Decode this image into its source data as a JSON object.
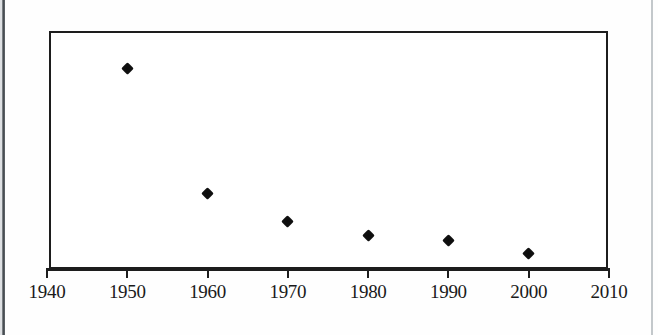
{
  "chart_data": {
    "type": "scatter",
    "title": "",
    "subtitle": "",
    "xlabel": "",
    "ylabel": "",
    "xlim": [
      1940,
      2010
    ],
    "ylim": [
      0,
      1
    ],
    "grid": false,
    "legend": null,
    "x_tick_labels": [
      "1940",
      "1950",
      "1960",
      "1970",
      "1980",
      "1990",
      "2000",
      "2010"
    ],
    "x_ticks": [
      1940,
      1950,
      1960,
      1970,
      1980,
      1990,
      2000,
      2010
    ],
    "y_tick_labels": [],
    "y_ticks": [],
    "marker": "diamond",
    "marker_color": "#111111",
    "series": [
      {
        "name": "series-1",
        "x": [
          1950,
          1960,
          1970,
          1980,
          1990,
          2000
        ],
        "values": [
          0.85,
          0.32,
          0.2,
          0.14,
          0.12,
          0.067
        ]
      }
    ],
    "annotations": []
  },
  "frame": {
    "border_color": "#1d1d1d",
    "background": "#ffffff"
  },
  "page": {
    "background": "#fefefe",
    "gutter_color": "#3a3f44"
  }
}
